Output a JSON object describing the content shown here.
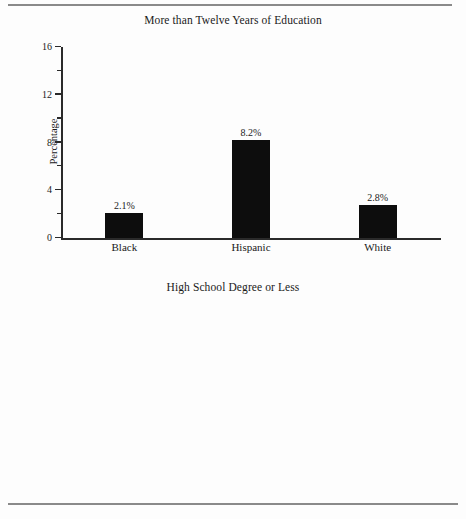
{
  "figure": {
    "rule_color": "#8a8a8a",
    "axis_color": "#2a2a2a",
    "bar_color": "#0d0d0d",
    "background": "#fdfdfd"
  },
  "chart_data": [
    {
      "type": "bar",
      "title": "More than Twelve Years of Education",
      "xlabel": "",
      "ylabel": "Percentage",
      "categories": [
        "Black",
        "Hispanic",
        "White"
      ],
      "values": [
        2.1,
        8.2,
        2.8
      ],
      "value_labels": [
        "2.1%",
        "8.2%",
        "2.8%"
      ],
      "ylim": [
        0,
        16
      ],
      "yticks": [
        0,
        4,
        8,
        12,
        16
      ],
      "ytick_labels": [
        "0",
        "4",
        "8",
        "12",
        "16"
      ],
      "yminor_ticks": [
        2,
        6,
        10,
        14
      ],
      "grid": false,
      "legend": "none"
    },
    {
      "type": "bar",
      "title": "High School Degree or Less",
      "xlabel": "",
      "ylabel": "Percentage",
      "categories": [
        "Black",
        "Hispanic",
        "White"
      ],
      "values": [
        15.2,
        7.1,
        7.1
      ],
      "value_labels": [
        "15.2%",
        "7.1%",
        "7.1%"
      ],
      "ylim": [
        0,
        16
      ],
      "yticks": [
        0,
        4,
        8,
        12,
        16
      ],
      "ytick_labels": [
        "0",
        "4",
        "8",
        "12",
        "16"
      ],
      "yminor_ticks": [
        2,
        6,
        10,
        14
      ],
      "grid": false,
      "legend": "none"
    }
  ]
}
